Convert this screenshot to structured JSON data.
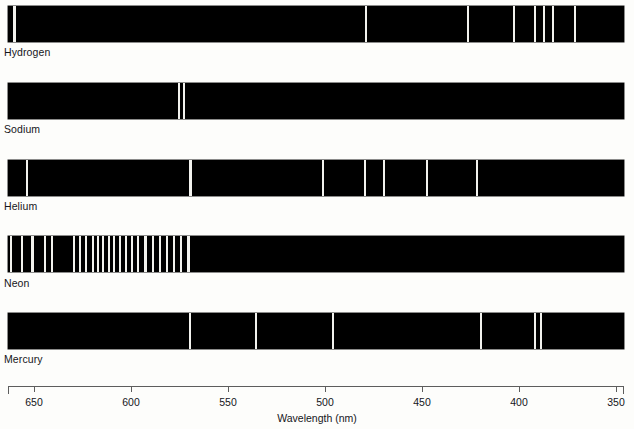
{
  "figure": {
    "background_color": "#fdfdfb",
    "band_color": "#000000",
    "line_color": "#f2f2ee"
  },
  "axis": {
    "title": "Wavelength (nm)",
    "unit": "nm",
    "direction": "descending",
    "range_nm": [
      663,
      347
    ],
    "pixel_range": [
      8,
      624
    ],
    "ticks": [
      {
        "label": "650",
        "value_nm": 650,
        "x": 34
      },
      {
        "label": "600",
        "value_nm": 600,
        "x": 131
      },
      {
        "label": "550",
        "value_nm": 550,
        "x": 228
      },
      {
        "label": "500",
        "value_nm": 500,
        "x": 325
      },
      {
        "label": "450",
        "value_nm": 450,
        "x": 422
      },
      {
        "label": "400",
        "value_nm": 400,
        "x": 519
      },
      {
        "label": "350",
        "value_nm": 350,
        "x": 616
      }
    ]
  },
  "chart_data": {
    "type": "line",
    "xlabel": "Wavelength (nm)",
    "ylabel": "",
    "xlim": [
      663,
      347
    ],
    "grid": false,
    "legend": "none",
    "note": "Each horizontal black band is an atomic line-emission spectrum; bright vertical lines mark emitted wavelengths.",
    "categories": [
      "Hydrogen",
      "Sodium",
      "Helium",
      "Neon",
      "Mercury"
    ],
    "series": [
      {
        "name": "Hydrogen",
        "label": "Hydrogen",
        "band": {
          "x": 8,
          "y": 6,
          "width": 616,
          "height": 36
        },
        "label_pos": {
          "x": 4,
          "y": 46
        },
        "lines_nm": [
          656,
          486,
          434,
          410,
          404,
          397,
          389
        ],
        "lines_px": [
          {
            "x": 13,
            "width": 2.5
          },
          {
            "x": 365,
            "width": 2.0
          },
          {
            "x": 467,
            "width": 2.0
          },
          {
            "x": 513,
            "width": 1.6
          },
          {
            "x": 534,
            "width": 1.6
          },
          {
            "x": 543,
            "width": 1.6
          },
          {
            "x": 552,
            "width": 2.0
          },
          {
            "x": 574,
            "width": 2.0
          }
        ]
      },
      {
        "name": "Sodium",
        "label": "Sodium",
        "band": {
          "x": 8,
          "y": 83,
          "width": 616,
          "height": 36
        },
        "label_pos": {
          "x": 4,
          "y": 123
        },
        "lines_nm": [
          589.0,
          589.6
        ],
        "lines_px": [
          {
            "x": 178,
            "width": 2.0
          },
          {
            "x": 183,
            "width": 2.0
          }
        ]
      },
      {
        "name": "Helium",
        "label": "Helium",
        "band": {
          "x": 8,
          "y": 160,
          "width": 616,
          "height": 36
        },
        "label_pos": {
          "x": 4,
          "y": 200
        },
        "lines_nm": [
          667,
          587,
          502,
          492,
          471,
          447,
          403
        ],
        "lines_px": [
          {
            "x": 26,
            "width": 2.0
          },
          {
            "x": 189,
            "width": 2.5
          },
          {
            "x": 322,
            "width": 1.6
          },
          {
            "x": 364,
            "width": 2.0
          },
          {
            "x": 383,
            "width": 2.0
          },
          {
            "x": 426,
            "width": 2.0
          },
          {
            "x": 476,
            "width": 2.0
          }
        ]
      },
      {
        "name": "Neon",
        "label": "Neon",
        "band": {
          "x": 8,
          "y": 236,
          "width": 616,
          "height": 36
        },
        "label_pos": {
          "x": 4,
          "y": 277
        },
        "lines_nm": [
          659,
          653,
          650,
          644,
          640,
          630,
          626,
          621,
          616,
          614,
          611,
          609,
          607,
          603,
          598,
          597,
          594,
          591,
          588,
          585,
          582,
          576,
          574,
          571,
          567,
          565,
          540
        ],
        "lines_px": [
          {
            "x": 10,
            "width": 2.2
          },
          {
            "x": 21,
            "width": 2.2
          },
          {
            "x": 31,
            "width": 2.6
          },
          {
            "x": 44,
            "width": 2.2
          },
          {
            "x": 51,
            "width": 2.2
          },
          {
            "x": 73,
            "width": 2.2
          },
          {
            "x": 79,
            "width": 2.2
          },
          {
            "x": 85,
            "width": 2.2
          },
          {
            "x": 92,
            "width": 2.2
          },
          {
            "x": 97,
            "width": 2.2
          },
          {
            "x": 102,
            "width": 2.2
          },
          {
            "x": 108,
            "width": 2.2
          },
          {
            "x": 113,
            "width": 2.2
          },
          {
            "x": 119,
            "width": 2.2
          },
          {
            "x": 125,
            "width": 2.2
          },
          {
            "x": 131,
            "width": 2.2
          },
          {
            "x": 137,
            "width": 2.2
          },
          {
            "x": 144,
            "width": 2.6
          },
          {
            "x": 152,
            "width": 2.2
          },
          {
            "x": 159,
            "width": 2.2
          },
          {
            "x": 166,
            "width": 2.2
          },
          {
            "x": 173,
            "width": 2.2
          },
          {
            "x": 180,
            "width": 2.2
          },
          {
            "x": 187,
            "width": 2.6
          }
        ]
      },
      {
        "name": "Mercury",
        "label": "Mercury",
        "band": {
          "x": 8,
          "y": 313,
          "width": 616,
          "height": 36
        },
        "label_pos": {
          "x": 4,
          "y": 353
        },
        "lines_nm": [
          579,
          546,
          492,
          436,
          408,
          405
        ],
        "lines_px": [
          {
            "x": 189,
            "width": 2.2
          },
          {
            "x": 255,
            "width": 2.2
          },
          {
            "x": 332,
            "width": 2.2
          },
          {
            "x": 480,
            "width": 2.2
          },
          {
            "x": 534,
            "width": 2.0
          },
          {
            "x": 540,
            "width": 2.0
          }
        ]
      }
    ]
  }
}
